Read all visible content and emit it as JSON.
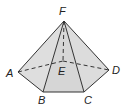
{
  "figure": {
    "type": "pentagonal pyramid",
    "colors": {
      "face": "#d9d9d9",
      "face_light": "#e6e6e6",
      "edge": "#333333"
    },
    "vertices": {
      "A": {
        "label": "A",
        "x": 18,
        "y": 72
      },
      "B": {
        "label": "B",
        "x": 43,
        "y": 92
      },
      "C": {
        "label": "C",
        "x": 84,
        "y": 92
      },
      "D": {
        "label": "D",
        "x": 109,
        "y": 70
      },
      "E": {
        "label": "E",
        "x": 63,
        "y": 61
      },
      "F": {
        "label": "F",
        "x": 64,
        "y": 21
      }
    },
    "labels": {
      "A": {
        "text": "A",
        "x": 6,
        "y": 77
      },
      "B": {
        "text": "B",
        "x": 38,
        "y": 104
      },
      "C": {
        "text": "C",
        "x": 84,
        "y": 104
      },
      "D": {
        "text": "D",
        "x": 112,
        "y": 74
      },
      "E": {
        "text": "E",
        "x": 58,
        "y": 75
      },
      "F": {
        "text": "F",
        "x": 59,
        "y": 15
      }
    },
    "solid_edges": [
      "FA",
      "FB",
      "FC",
      "FD",
      "AB",
      "BC",
      "CD"
    ],
    "hidden_edges": [
      "FE",
      "AE",
      "ED"
    ]
  }
}
